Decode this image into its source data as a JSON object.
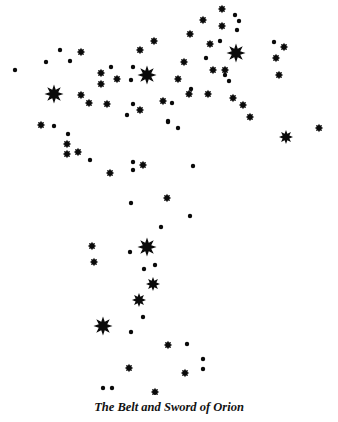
{
  "caption": "The Belt and Sword of Orion",
  "colors": {
    "background": "#ffffff",
    "star": "#0a0a0a"
  },
  "stars": [
    {
      "x": 15,
      "y": 70,
      "size": "s"
    },
    {
      "x": 46,
      "y": 62,
      "size": "s"
    },
    {
      "x": 60,
      "y": 50,
      "size": "s"
    },
    {
      "x": 70,
      "y": 61,
      "size": "s"
    },
    {
      "x": 81,
      "y": 52,
      "size": "m"
    },
    {
      "x": 54,
      "y": 94,
      "size": "xl"
    },
    {
      "x": 81,
      "y": 95,
      "size": "m"
    },
    {
      "x": 89,
      "y": 103,
      "size": "m"
    },
    {
      "x": 101,
      "y": 73,
      "size": "m"
    },
    {
      "x": 101,
      "y": 84,
      "size": "m"
    },
    {
      "x": 111,
      "y": 67,
      "size": "s"
    },
    {
      "x": 117,
      "y": 79,
      "size": "m"
    },
    {
      "x": 107,
      "y": 104,
      "size": "m"
    },
    {
      "x": 133,
      "y": 67,
      "size": "s"
    },
    {
      "x": 131,
      "y": 80,
      "size": "s"
    },
    {
      "x": 140,
      "y": 50,
      "size": "m"
    },
    {
      "x": 147,
      "y": 75,
      "size": "xl"
    },
    {
      "x": 154,
      "y": 41,
      "size": "m"
    },
    {
      "x": 140,
      "y": 110,
      "size": "m"
    },
    {
      "x": 133,
      "y": 104,
      "size": "s"
    },
    {
      "x": 127,
      "y": 115,
      "size": "s"
    },
    {
      "x": 178,
      "y": 79,
      "size": "m"
    },
    {
      "x": 184,
      "y": 62,
      "size": "m"
    },
    {
      "x": 163,
      "y": 101,
      "size": "m"
    },
    {
      "x": 168,
      "y": 121,
      "size": "s"
    },
    {
      "x": 178,
      "y": 128,
      "size": "s"
    },
    {
      "x": 172,
      "y": 103,
      "size": "s"
    },
    {
      "x": 190,
      "y": 34,
      "size": "m"
    },
    {
      "x": 203,
      "y": 20,
      "size": "m"
    },
    {
      "x": 222,
      "y": 9,
      "size": "m"
    },
    {
      "x": 235,
      "y": 15,
      "size": "s"
    },
    {
      "x": 239,
      "y": 21,
      "size": "s"
    },
    {
      "x": 222,
      "y": 26,
      "size": "m"
    },
    {
      "x": 237,
      "y": 30,
      "size": "s"
    },
    {
      "x": 210,
      "y": 44,
      "size": "m"
    },
    {
      "x": 220,
      "y": 41,
      "size": "s"
    },
    {
      "x": 236,
      "y": 53,
      "size": "xl"
    },
    {
      "x": 206,
      "y": 58,
      "size": "s"
    },
    {
      "x": 213,
      "y": 70,
      "size": "m"
    },
    {
      "x": 225,
      "y": 70,
      "size": "m"
    },
    {
      "x": 225,
      "y": 75,
      "size": "s"
    },
    {
      "x": 229,
      "y": 81,
      "size": "s"
    },
    {
      "x": 274,
      "y": 42,
      "size": "s"
    },
    {
      "x": 284,
      "y": 47,
      "size": "m"
    },
    {
      "x": 276,
      "y": 58,
      "size": "m"
    },
    {
      "x": 279,
      "y": 75,
      "size": "m"
    },
    {
      "x": 189,
      "y": 94,
      "size": "m"
    },
    {
      "x": 191,
      "y": 89,
      "size": "s"
    },
    {
      "x": 208,
      "y": 94,
      "size": "m"
    },
    {
      "x": 233,
      "y": 98,
      "size": "m"
    },
    {
      "x": 243,
      "y": 105,
      "size": "m"
    },
    {
      "x": 250,
      "y": 117,
      "size": "m"
    },
    {
      "x": 168,
      "y": 122,
      "size": "s"
    },
    {
      "x": 286,
      "y": 137,
      "size": "l"
    },
    {
      "x": 319,
      "y": 128,
      "size": "m"
    },
    {
      "x": 41,
      "y": 125,
      "size": "m"
    },
    {
      "x": 54,
      "y": 126,
      "size": "s"
    },
    {
      "x": 68,
      "y": 134,
      "size": "s"
    },
    {
      "x": 67,
      "y": 144,
      "size": "m"
    },
    {
      "x": 67,
      "y": 154,
      "size": "m"
    },
    {
      "x": 78,
      "y": 152,
      "size": "m"
    },
    {
      "x": 90,
      "y": 160,
      "size": "s"
    },
    {
      "x": 110,
      "y": 173,
      "size": "m"
    },
    {
      "x": 133,
      "y": 162,
      "size": "s"
    },
    {
      "x": 133,
      "y": 170,
      "size": "s"
    },
    {
      "x": 143,
      "y": 165,
      "size": "m"
    },
    {
      "x": 193,
      "y": 166,
      "size": "s"
    },
    {
      "x": 131,
      "y": 203,
      "size": "s"
    },
    {
      "x": 167,
      "y": 198,
      "size": "m"
    },
    {
      "x": 190,
      "y": 216,
      "size": "s"
    },
    {
      "x": 161,
      "y": 227,
      "size": "s"
    },
    {
      "x": 92,
      "y": 246,
      "size": "m"
    },
    {
      "x": 94,
      "y": 262,
      "size": "m"
    },
    {
      "x": 130,
      "y": 252,
      "size": "s"
    },
    {
      "x": 147,
      "y": 247,
      "size": "xl"
    },
    {
      "x": 144,
      "y": 269,
      "size": "s"
    },
    {
      "x": 155,
      "y": 265,
      "size": "s"
    },
    {
      "x": 153,
      "y": 284,
      "size": "l"
    },
    {
      "x": 139,
      "y": 300,
      "size": "l"
    },
    {
      "x": 143,
      "y": 317,
      "size": "s"
    },
    {
      "x": 103,
      "y": 326,
      "size": "xl"
    },
    {
      "x": 131,
      "y": 332,
      "size": "s"
    },
    {
      "x": 168,
      "y": 345,
      "size": "m"
    },
    {
      "x": 187,
      "y": 344,
      "size": "s"
    },
    {
      "x": 203,
      "y": 359,
      "size": "s"
    },
    {
      "x": 203,
      "y": 369,
      "size": "s"
    },
    {
      "x": 129,
      "y": 368,
      "size": "m"
    },
    {
      "x": 185,
      "y": 373,
      "size": "m"
    },
    {
      "x": 103,
      "y": 388,
      "size": "s"
    },
    {
      "x": 112,
      "y": 388,
      "size": "s"
    },
    {
      "x": 155,
      "y": 392,
      "size": "m"
    }
  ]
}
